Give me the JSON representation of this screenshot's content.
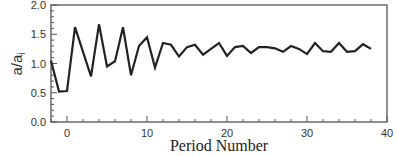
{
  "chart_data": {
    "type": "line",
    "title": "",
    "xlabel": "Period Number",
    "ylabel": "a/a",
    "ylabel_subscript": "i",
    "xlim": [
      -2,
      40
    ],
    "ylim": [
      0.0,
      2.0
    ],
    "x_ticks": [
      0,
      10,
      20,
      30,
      40
    ],
    "x_tick_labels": [
      "0",
      "10",
      "20",
      "30",
      "40"
    ],
    "y_ticks": [
      0.0,
      0.5,
      1.0,
      1.5,
      2.0
    ],
    "y_tick_labels": [
      "0.0",
      "0.5",
      "1.0",
      "1.5",
      "2.0"
    ],
    "grid": false,
    "legend": null,
    "series": [
      {
        "name": "a/ai",
        "color": "#222222",
        "x": [
          -2,
          -1,
          0,
          1,
          2,
          3,
          4,
          5,
          6,
          7,
          8,
          9,
          10,
          11,
          12,
          13,
          14,
          15,
          16,
          17,
          18,
          19,
          20,
          21,
          22,
          23,
          24,
          25,
          26,
          27,
          28,
          29,
          30,
          31,
          32,
          33,
          34,
          35,
          36,
          37,
          38
        ],
        "values": [
          1.05,
          0.52,
          0.53,
          1.62,
          1.2,
          0.78,
          1.67,
          0.95,
          1.04,
          1.62,
          0.8,
          1.3,
          1.45,
          0.93,
          1.35,
          1.32,
          1.12,
          1.28,
          1.32,
          1.15,
          1.25,
          1.35,
          1.13,
          1.28,
          1.3,
          1.18,
          1.28,
          1.28,
          1.26,
          1.2,
          1.3,
          1.25,
          1.16,
          1.35,
          1.21,
          1.2,
          1.35,
          1.2,
          1.21,
          1.33,
          1.25
        ]
      }
    ]
  }
}
